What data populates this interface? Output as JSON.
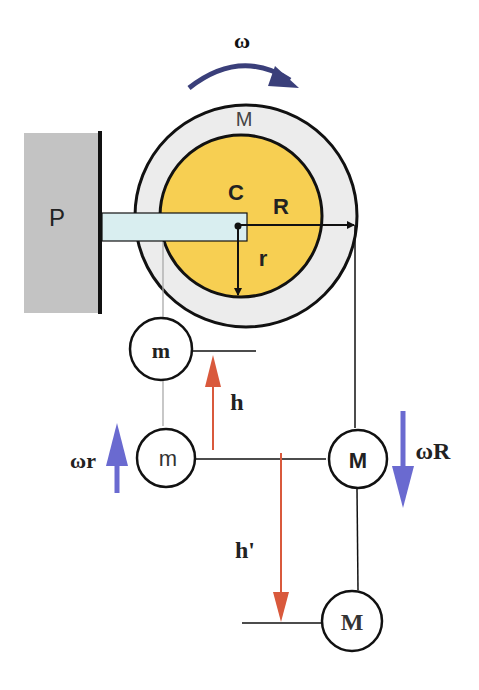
{
  "diagram": {
    "colors": {
      "wall": "#c3c3c3",
      "outer_disk": "#ececec",
      "inner_disk": "#f7cf52",
      "arm": "#d9eef0",
      "outline": "#111111",
      "red_arrow": "#d9593c",
      "blue_arrow": "#6a6ad0",
      "omega_arrow": "#3a3f7a",
      "string_grey": "#aaaaaa"
    },
    "labels": {
      "omega": "ω",
      "wall": "P",
      "outer_mass": "M",
      "center": "C",
      "outer_radius": "R",
      "inner_radius": "r",
      "mass_m_top": "m",
      "mass_m_bottom": "m",
      "mass_M_mid": "M",
      "mass_M_bottom": "M",
      "height_h": "h",
      "height_h_prime": "h'",
      "velocity_m": "ωr",
      "velocity_M": "ωR"
    }
  }
}
